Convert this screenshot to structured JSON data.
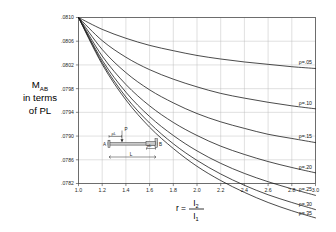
{
  "chart_data": {
    "type": "line",
    "title": "",
    "xlabel": "r = I2 / I1",
    "xlabel_parts": {
      "lead": "r =",
      "numerator": "I",
      "numerator_sub": "2",
      "denominator": "I",
      "denominator_sub": "1"
    },
    "ylabel": "M_AB in terms of PL",
    "ylabel_lines": [
      "M",
      "AB",
      "in terms",
      "of PL"
    ],
    "xlim": [
      1.0,
      3.0
    ],
    "ylim": [
      0.0782,
      0.081
    ],
    "xticks": [
      "1.0",
      "1.2",
      "1.4",
      "1.6",
      "1.8",
      "2.0",
      "2.2",
      "2.4",
      "2.6",
      "2.8",
      "3.0"
    ],
    "xtick_values": [
      1.0,
      1.2,
      1.4,
      1.6,
      1.8,
      2.0,
      2.2,
      2.4,
      2.6,
      2.8,
      3.0
    ],
    "yticks": [
      ".0810",
      ".0806",
      ".0802",
      ".0798",
      ".0794",
      ".0790",
      ".0786",
      ".0782"
    ],
    "ytick_values": [
      0.081,
      0.0806,
      0.0802,
      0.0798,
      0.0794,
      0.079,
      0.0786,
      0.0782
    ],
    "grid": true,
    "legend_position": "right-inline",
    "series": [
      {
        "name": "p=.05",
        "label": "ρ=.05",
        "x": [
          1.0,
          1.2,
          1.4,
          1.6,
          1.8,
          2.0,
          2.2,
          2.4,
          2.6,
          2.8,
          3.0
        ],
        "values": [
          0.081,
          0.0808,
          0.08065,
          0.08053,
          0.08044,
          0.08036,
          0.0803,
          0.08025,
          0.08021,
          0.08017,
          0.08014
        ]
      },
      {
        "name": "p=.10",
        "label": "ρ=.10",
        "x": [
          1.0,
          1.2,
          1.4,
          1.6,
          1.8,
          2.0,
          2.2,
          2.4,
          2.6,
          2.8,
          3.0
        ],
        "values": [
          0.081,
          0.08061,
          0.08033,
          0.08012,
          0.07996,
          0.07983,
          0.07972,
          0.07964,
          0.07957,
          0.07951,
          0.07946
        ]
      },
      {
        "name": "p=.15",
        "label": "ρ=.15",
        "x": [
          1.0,
          1.2,
          1.4,
          1.6,
          1.8,
          2.0,
          2.2,
          2.4,
          2.6,
          2.8,
          3.0
        ],
        "values": [
          0.081,
          0.08046,
          0.08007,
          0.07978,
          0.07956,
          0.07938,
          0.07924,
          0.07913,
          0.07903,
          0.07896,
          0.07889
        ]
      },
      {
        "name": "p=.20",
        "label": "ρ=.20",
        "x": [
          1.0,
          1.2,
          1.4,
          1.6,
          1.8,
          2.0,
          2.2,
          2.4,
          2.6,
          2.8,
          3.0
        ],
        "values": [
          0.081,
          0.08035,
          0.07987,
          0.07951,
          0.07923,
          0.07901,
          0.07883,
          0.07869,
          0.07857,
          0.07847,
          0.07838
        ]
      },
      {
        "name": "p=.25",
        "label": "ρ=.25",
        "x": [
          1.0,
          1.2,
          1.4,
          1.6,
          1.8,
          2.0,
          2.2,
          2.4,
          2.6,
          2.8,
          3.0
        ],
        "values": [
          0.081,
          0.08028,
          0.07974,
          0.07933,
          0.07901,
          0.07875,
          0.07854,
          0.07837,
          0.07823,
          0.07811,
          0.078
        ]
      },
      {
        "name": "p=.30",
        "label": "ρ=.30",
        "x": [
          1.0,
          1.2,
          1.4,
          1.6,
          1.8,
          2.0,
          2.2,
          2.4,
          2.6,
          2.8,
          3.0
        ],
        "values": [
          0.081,
          0.08024,
          0.07966,
          0.07922,
          0.07887,
          0.07859,
          0.07836,
          0.07817,
          0.07801,
          0.07788,
          0.07776
        ]
      },
      {
        "name": "p=.35",
        "label": "ρ=.35",
        "x": [
          1.0,
          1.2,
          1.4,
          1.6,
          1.8,
          2.0,
          2.2,
          2.4,
          2.6,
          2.8,
          3.0
        ],
        "values": [
          0.081,
          0.08021,
          0.07961,
          0.07915,
          0.07879,
          0.07849,
          0.07825,
          0.07805,
          0.07788,
          0.07774,
          0.07762
        ]
      }
    ]
  },
  "inset": {
    "label_a": "A",
    "label_b": "B",
    "label_p": "P",
    "label_span": "L",
    "label_left_segment": "ρL",
    "label_right_segment": "ρL"
  },
  "colors": {
    "curve": "#171717",
    "grid": "#b9b9b9",
    "frame": "#4a4a4a",
    "text": "#1a1a1a",
    "inset_fill": "#c9c9c9"
  }
}
